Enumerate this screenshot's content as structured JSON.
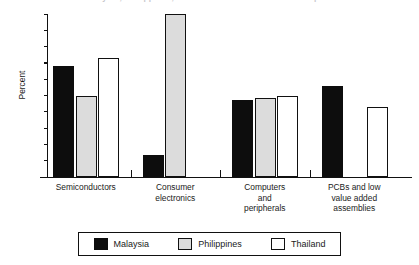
{
  "chart_data": {
    "type": "bar",
    "title": "Malaysia, Philippines, Thailand: share of electronics exports",
    "subtitle": "",
    "xlabel": "",
    "ylabel": "Percent",
    "ylim": [
      0,
      100
    ],
    "yticks": [
      0,
      10,
      20,
      30,
      40,
      50,
      60,
      70,
      80,
      90,
      100
    ],
    "ytick_labels": [
      "0",
      "10",
      "20",
      "30",
      "40",
      "50",
      "60",
      "70",
      "80",
      "90",
      "100"
    ],
    "grid": false,
    "legend_position": "bottom",
    "categories": [
      "Semiconductors",
      "Consumer electronics",
      "Computers and peripherals",
      "PCBs and low value added assemblies"
    ],
    "category_label_lines": [
      [
        "Semiconductors"
      ],
      [
        "Consumer",
        "electronics"
      ],
      [
        "Computers",
        "and",
        "peripherals"
      ],
      [
        "PCBs and low",
        "value added",
        "assemblies"
      ]
    ],
    "series": [
      {
        "name": "Malaysia",
        "color": "#0d0d0d",
        "values": [
          68,
          13.5,
          47,
          56
        ]
      },
      {
        "name": "Philippines",
        "color": "#dcdcdc",
        "values": [
          50,
          100,
          48.5,
          null
        ]
      },
      {
        "name": "Thailand",
        "color": "#ffffff",
        "values": [
          73,
          null,
          50,
          43
        ]
      }
    ]
  },
  "legend": {
    "items": [
      {
        "label": "Malaysia"
      },
      {
        "label": "Philippines"
      },
      {
        "label": "Thailand"
      }
    ]
  }
}
